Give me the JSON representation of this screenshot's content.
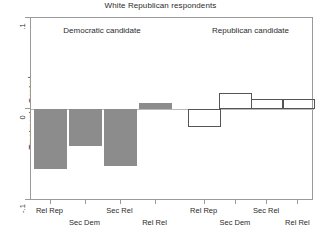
{
  "chart_data": {
    "type": "bar",
    "title": "White Republican respondents",
    "subtitle": "",
    "xlabel": "",
    "ylabel": "Treatment - Control",
    "ylim": [
      -0.1,
      0.1
    ],
    "yticks": [
      0.1,
      0,
      -0.1
    ],
    "ytick_labels": [
      ".1",
      "0",
      "-.1"
    ],
    "grid": false,
    "legend_position": "none",
    "categories": [
      "Rel Rep",
      "Sec Dem",
      "Sec Rel",
      "Rel Rel"
    ],
    "panels": [
      {
        "name": "democratic",
        "caption": "Democratic candidate",
        "style": "filled",
        "fill_color": "#8c8c8c",
        "border_color": "#8c8c8c",
        "categories": [
          "Rel Rep",
          "Sec Dem",
          "Sec Rel",
          "Rel Rel"
        ],
        "values": [
          -0.066,
          -0.041,
          -0.063,
          0.007
        ]
      },
      {
        "name": "republican",
        "caption": "Republican candidate",
        "style": "hollow",
        "fill_color": "transparent",
        "border_color": "#555555",
        "categories": [
          "Rel Rep",
          "Sec Dem",
          "Sec Rel",
          "Rel Rel"
        ],
        "values": [
          -0.02,
          0.018,
          0.011,
          0.011
        ]
      }
    ],
    "series": [
      {
        "name": "Democratic candidate",
        "values": [
          -0.066,
          -0.041,
          -0.063,
          0.007
        ]
      },
      {
        "name": "Republican candidate",
        "values": [
          -0.02,
          0.018,
          0.011,
          0.011
        ]
      }
    ]
  },
  "colors": {
    "axis": "#9a9a9a",
    "text": "#2b2b2b",
    "zero_line": "#b9b9b9",
    "bar_filled": "#8c8c8c",
    "bar_hollow_border": "#555555",
    "background": "#ffffff"
  }
}
